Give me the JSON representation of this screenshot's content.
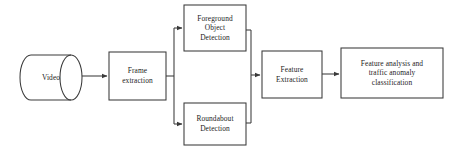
{
  "diagram": {
    "background_color": "#ffffff",
    "stroke_color": "#3a3a3a",
    "text_color": "#1d1d1d",
    "nodes": [
      {
        "id": "video",
        "shape": "cylinder",
        "lines": [
          "Video"
        ],
        "x": 20,
        "y": 55,
        "w": 62,
        "h": 45
      },
      {
        "id": "frame-extraction",
        "shape": "rect",
        "lines": [
          "Frame",
          "extraction"
        ],
        "x": 109,
        "y": 52,
        "w": 57,
        "h": 48
      },
      {
        "id": "foreground-object-detection",
        "shape": "rect",
        "lines": [
          "Foreground",
          "Object",
          "Detection"
        ],
        "x": 184,
        "y": 5,
        "w": 62,
        "h": 46
      },
      {
        "id": "roundabout-detection",
        "shape": "rect",
        "lines": [
          "Roundabout",
          "Detection"
        ],
        "x": 184,
        "y": 103,
        "w": 62,
        "h": 42
      },
      {
        "id": "feature-extraction",
        "shape": "rect",
        "lines": [
          "Feature",
          "Extraction"
        ],
        "x": 262,
        "y": 51,
        "w": 60,
        "h": 47
      },
      {
        "id": "feature-analysis-classification",
        "shape": "rect",
        "lines": [
          "Feature analysis and",
          "traffic anomaly",
          "classification"
        ],
        "x": 341,
        "y": 48,
        "w": 102,
        "h": 50
      }
    ],
    "connections": [
      {
        "id": "video-to-frame",
        "from": "video",
        "to": "frame-extraction",
        "arrow": true
      },
      {
        "id": "frame-to-split",
        "from": "frame-extraction",
        "to": "split-junction",
        "arrow": false
      },
      {
        "id": "split-to-foreground",
        "from": "split-junction",
        "to": "foreground-object-detection",
        "arrow": true
      },
      {
        "id": "split-to-roundabout",
        "from": "split-junction",
        "to": "roundabout-detection",
        "arrow": true
      },
      {
        "id": "foreground-to-merge",
        "from": "foreground-object-detection",
        "to": "merge-junction",
        "arrow": false
      },
      {
        "id": "roundabout-to-merge",
        "from": "roundabout-detection",
        "to": "merge-junction",
        "arrow": false
      },
      {
        "id": "merge-to-feature-extraction",
        "from": "merge-junction",
        "to": "feature-extraction",
        "arrow": true
      },
      {
        "id": "feature-to-analysis",
        "from": "feature-extraction",
        "to": "feature-analysis-classification",
        "arrow": true
      }
    ]
  }
}
